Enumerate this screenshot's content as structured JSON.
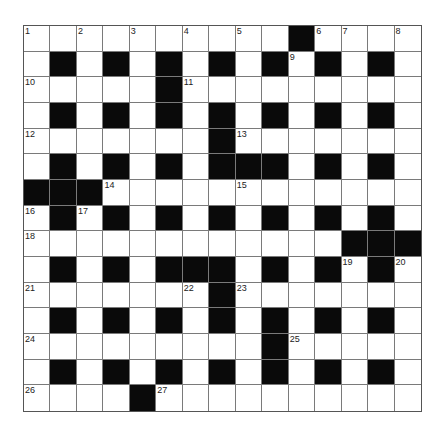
{
  "puzzle": {
    "rows": 15,
    "cols": 15,
    "colors": {
      "block": "#0a0a0a",
      "cell": "#ffffff",
      "line": "#7a7a7a",
      "border": "#555555"
    },
    "layout": [
      "..........#....",
      ".#.#.#.#.#.#.#.",
      ".....#.........",
      ".#.#.#.#.#.#.#.",
      ".......#.......",
      ".#.#.#.###.#.#.",
      "###............",
      ".#.#.#.#.#.#.#.",
      "............###",
      ".#.#.###.#.#.#.",
      ".......#.......",
      ".#.#.#.#.#.#.#.",
      ".........#.....",
      ".#.#.#.#.#.#.#.",
      "....#.........."
    ],
    "numbers": [
      {
        "r": 0,
        "c": 0,
        "n": "1"
      },
      {
        "r": 0,
        "c": 2,
        "n": "2"
      },
      {
        "r": 0,
        "c": 4,
        "n": "3"
      },
      {
        "r": 0,
        "c": 6,
        "n": "4"
      },
      {
        "r": 0,
        "c": 8,
        "n": "5"
      },
      {
        "r": 0,
        "c": 11,
        "n": "6"
      },
      {
        "r": 0,
        "c": 12,
        "n": "7"
      },
      {
        "r": 0,
        "c": 14,
        "n": "8"
      },
      {
        "r": 1,
        "c": 10,
        "n": "9"
      },
      {
        "r": 2,
        "c": 0,
        "n": "10"
      },
      {
        "r": 2,
        "c": 6,
        "n": "11"
      },
      {
        "r": 4,
        "c": 0,
        "n": "12"
      },
      {
        "r": 4,
        "c": 8,
        "n": "13"
      },
      {
        "r": 6,
        "c": 3,
        "n": "14"
      },
      {
        "r": 6,
        "c": 8,
        "n": "15"
      },
      {
        "r": 7,
        "c": 0,
        "n": "16"
      },
      {
        "r": 7,
        "c": 2,
        "n": "17"
      },
      {
        "r": 8,
        "c": 0,
        "n": "18"
      },
      {
        "r": 9,
        "c": 12,
        "n": "19"
      },
      {
        "r": 9,
        "c": 14,
        "n": "20"
      },
      {
        "r": 10,
        "c": 0,
        "n": "21"
      },
      {
        "r": 10,
        "c": 6,
        "n": "22"
      },
      {
        "r": 10,
        "c": 8,
        "n": "23"
      },
      {
        "r": 12,
        "c": 0,
        "n": "24"
      },
      {
        "r": 12,
        "c": 10,
        "n": "25"
      },
      {
        "r": 14,
        "c": 0,
        "n": "26"
      },
      {
        "r": 14,
        "c": 5,
        "n": "27"
      }
    ]
  }
}
